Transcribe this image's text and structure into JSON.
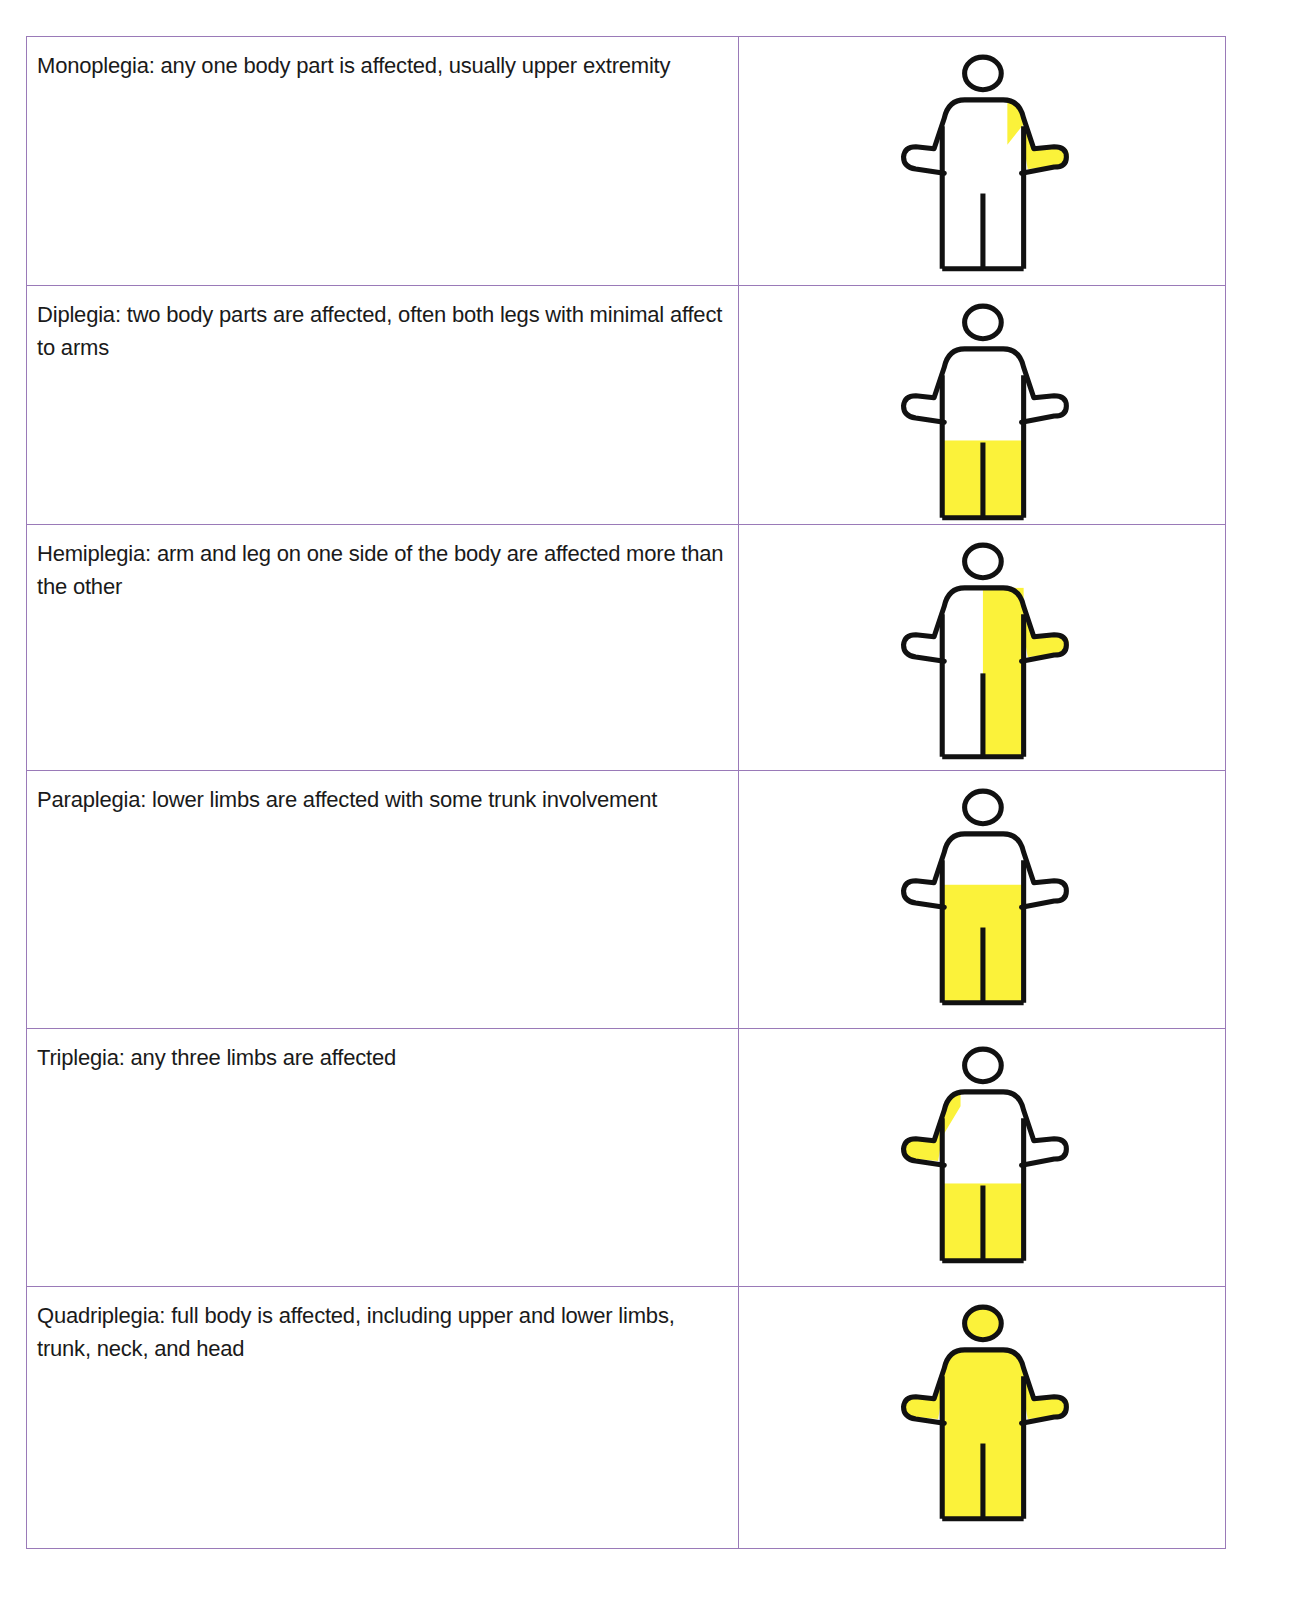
{
  "colors": {
    "border": "#9a7ab8",
    "outline": "#111111",
    "affected": "#fbf23a",
    "background": "#ffffff"
  },
  "rows": [
    {
      "text": "Monoplegia: any one body part is affected, usually upper extremity",
      "figure": {
        "head": false,
        "left_arm": false,
        "right_arm": true,
        "right_shoulder": true,
        "torso_right_half": false,
        "legs_from": null,
        "full": false
      },
      "height": 248
    },
    {
      "text": "Diplegia: two body parts are affected, often both legs with minimal affect to arms",
      "figure": {
        "head": false,
        "left_arm": false,
        "right_arm": false,
        "right_shoulder": false,
        "torso_right_half": false,
        "legs_from": "knee",
        "full": false
      },
      "height": 239
    },
    {
      "text": "Hemiplegia: arm and leg on one side of the body are affected more than the other",
      "figure": {
        "head": false,
        "left_arm": false,
        "right_arm": true,
        "right_shoulder": true,
        "torso_right_half": true,
        "legs_from": null,
        "full": false
      },
      "height": 246
    },
    {
      "text": "Paraplegia: lower limbs are affected with some trunk involvement",
      "figure": {
        "head": false,
        "left_arm": false,
        "right_arm": false,
        "right_shoulder": false,
        "torso_right_half": false,
        "legs_from": "waist",
        "full": false
      },
      "height": 258
    },
    {
      "text": "Triplegia: any three limbs are affected",
      "figure": {
        "head": false,
        "left_arm": true,
        "left_shoulder": true,
        "right_arm": false,
        "torso_right_half": false,
        "legs_from": "knee",
        "full": false
      },
      "height": 258
    },
    {
      "text": "Quadriplegia: full body is affected, including upper and lower limbs, trunk, neck, and head",
      "figure": {
        "head": true,
        "left_arm": true,
        "right_arm": true,
        "torso_right_half": false,
        "legs_from": null,
        "full": true
      },
      "height": 262
    }
  ]
}
